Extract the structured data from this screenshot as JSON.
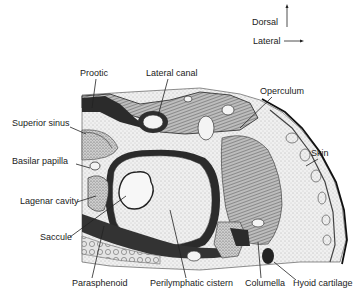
{
  "orientation": {
    "dorsal_label": "Dorsal",
    "lateral_label": "Lateral"
  },
  "labels": {
    "prootic": "Prootic",
    "lateral_canal": "Lateral canal",
    "operculum": "Operculum",
    "superior_sinus": "Superior sinus",
    "skin": "Skin",
    "basilar_papilla": "Basilar papilla",
    "lagenar_cavity": "Lagenar cavity",
    "saccule": "Saccule",
    "parasphenoid": "Parasphenoid",
    "perilymphatic_cistern": "Perilymphatic cistern",
    "columella": "Columella",
    "hyoid_cartilage": "Hyoid cartilage"
  },
  "colors": {
    "ink": "#222222",
    "dark_tissue": "#2b2b2b",
    "stipple_fill": "#d9d9d9",
    "light_fill": "#f2f2f2",
    "background": "#ffffff"
  }
}
